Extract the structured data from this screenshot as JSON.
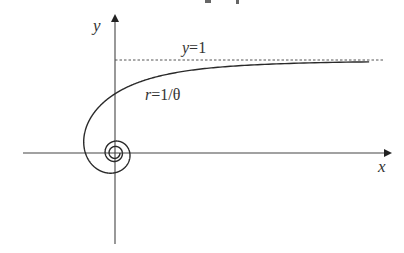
{
  "diagram": {
    "type": "polar-curve",
    "title_fragment": "y p",
    "axes": {
      "x_label": "x",
      "y_label": "y"
    },
    "curve": {
      "equation_lhs": "r",
      "equation_rhs": "=1/θ",
      "name": "hyperbolic spiral"
    },
    "asymptote": {
      "label_lhs": "y",
      "label_rhs": "=1"
    },
    "colors": {
      "axis": "#333333",
      "curve": "#2a2a2a",
      "asymptote": "#555555",
      "background": "#ffffff"
    }
  }
}
